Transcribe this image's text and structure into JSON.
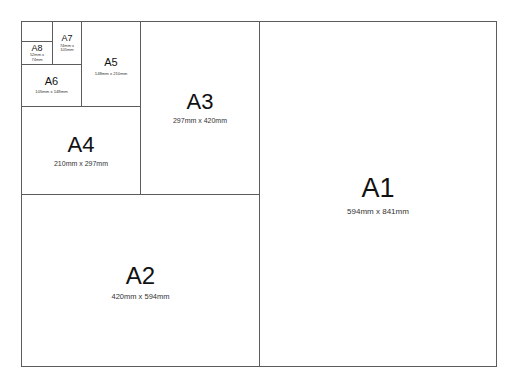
{
  "diagram": {
    "line_color": "#5c5c5c",
    "sheets": [
      {
        "id": "A1",
        "label": "A1",
        "dimensions": "594mm x 841mm"
      },
      {
        "id": "A2",
        "label": "A2",
        "dimensions": "420mm x 594mm"
      },
      {
        "id": "A3",
        "label": "A3",
        "dimensions": "297mm x 420mm"
      },
      {
        "id": "A4",
        "label": "A4",
        "dimensions": "210mm x 297mm"
      },
      {
        "id": "A5",
        "label": "A5",
        "dimensions": "148mm x 210mm"
      },
      {
        "id": "A6",
        "label": "A6",
        "dimensions": "105mm x 148mm"
      },
      {
        "id": "A7",
        "label": "A7",
        "dimensions_line1": "74mm x",
        "dimensions_line2": "105mm"
      },
      {
        "id": "A8",
        "label": "A8",
        "dimensions_line1": "52mm x",
        "dimensions_line2": "74mm"
      }
    ]
  }
}
